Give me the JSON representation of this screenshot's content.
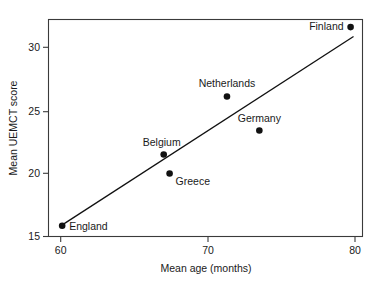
{
  "chart_data": {
    "type": "scatter",
    "title": "",
    "xlabel": "Mean age (months)",
    "ylabel": "Mean UEMCT score",
    "xlim": [
      59.3,
      80.7
    ],
    "ylim": [
      14.5,
      32.2
    ],
    "xticks": [
      60,
      70,
      80
    ],
    "xtick_labels": [
      "60",
      "70",
      "80"
    ],
    "yticks": [
      15,
      20,
      25,
      30
    ],
    "ytick_labels": [
      "15",
      "20",
      "25",
      "30"
    ],
    "grid": false,
    "legend": "none",
    "points": [
      {
        "label": "England",
        "x": 60.1,
        "y": 15.85,
        "label_pos": "right"
      },
      {
        "label": "Belgium",
        "x": 67.0,
        "y": 21.5,
        "label_pos": "above-left"
      },
      {
        "label": "Greece",
        "x": 67.4,
        "y": 20.0,
        "label_pos": "below-right"
      },
      {
        "label": "Netherlands",
        "x": 71.3,
        "y": 26.1,
        "label_pos": "above"
      },
      {
        "label": "Germany",
        "x": 73.5,
        "y": 23.4,
        "label_pos": "above"
      },
      {
        "label": "Finland",
        "x": 79.7,
        "y": 31.6,
        "label_pos": "left"
      }
    ],
    "trendline": {
      "type": "linear-fit",
      "x_start": 59.95,
      "y_start": 15.8,
      "x_end": 79.9,
      "y_end": 30.85
    },
    "colors": {
      "point": "#111111",
      "line": "#111111",
      "axis": "#3a3a3a",
      "text": "#1a1a1a",
      "background": "#ffffff"
    }
  }
}
